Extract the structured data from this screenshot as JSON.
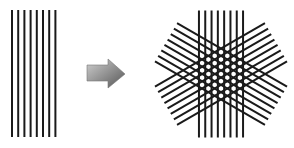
{
  "diagram": {
    "left_panel": {
      "label": "parallel-lines",
      "line_count": 8,
      "line_color": "#1a1a1a",
      "x_start": 12,
      "spacing": 6.2,
      "y_top": 10,
      "y_bottom": 137
    },
    "arrow": {
      "label": "transform-arrow",
      "direction": "right",
      "color_light": "#c8c8c8",
      "color_dark": "#5a5a5a"
    },
    "right_panel": {
      "label": "hexagonal-star-lattice",
      "center": [
        221,
        74
      ],
      "line_sets": [
        {
          "angle_deg": 0,
          "line_count": 8
        },
        {
          "angle_deg": 60,
          "line_count": 8
        },
        {
          "angle_deg": 120,
          "line_count": 8
        }
      ],
      "spacing": 6.3,
      "half_length": 63.5,
      "line_color": "#1a1a1a"
    }
  }
}
